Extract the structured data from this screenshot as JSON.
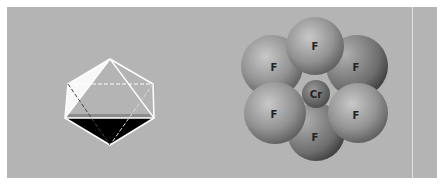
{
  "figure": {
    "left_panel": {
      "shape": "octahedron-wireframe",
      "colors": {
        "face_white": "#ffffff",
        "face_black": "#000000",
        "edge": "#ffffff"
      }
    },
    "right_panel": {
      "shape": "space-filling-model",
      "central_atom": {
        "label": "Cr"
      },
      "ligands": [
        {
          "label": "F",
          "position": "top"
        },
        {
          "label": "F",
          "position": "upper-left"
        },
        {
          "label": "F",
          "position": "upper-right"
        },
        {
          "label": "F",
          "position": "lower-left"
        },
        {
          "label": "F",
          "position": "lower-right"
        },
        {
          "label": "F",
          "position": "bottom"
        }
      ]
    },
    "colors": {
      "background": "#b4b4b4",
      "atom": "#8a8a8a"
    }
  }
}
